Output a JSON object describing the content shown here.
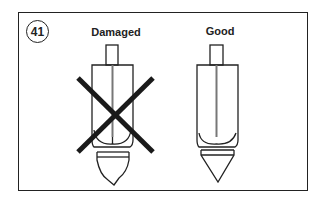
{
  "figure": {
    "number": "41",
    "labels": {
      "damaged": "Damaged",
      "good": "Good"
    },
    "colors": {
      "line": "#222222",
      "cross": "#1a1a1a",
      "background": "#ffffff"
    },
    "items": [
      {
        "name": "damaged-electrode",
        "status": "Damaged",
        "crossed_out": true
      },
      {
        "name": "good-electrode",
        "status": "Good",
        "crossed_out": false
      }
    ]
  }
}
